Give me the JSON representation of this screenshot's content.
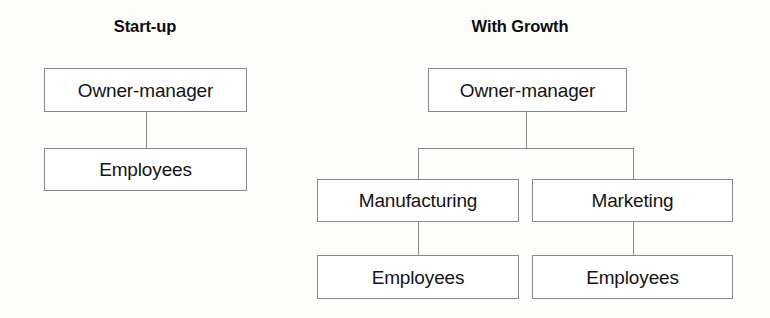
{
  "canvas": {
    "width": 770,
    "height": 318,
    "background": "#fdfdfc",
    "line_color": "#8a8a8a",
    "text_color": "#141414"
  },
  "panels": [
    {
      "id": "startup",
      "title": "Start-up",
      "nodes": [
        {
          "id": "startup-owner-manager",
          "label": "Owner-manager"
        },
        {
          "id": "startup-employees",
          "label": "Employees"
        }
      ]
    },
    {
      "id": "with-growth",
      "title": "With Growth",
      "nodes": [
        {
          "id": "growth-owner-manager",
          "label": "Owner-manager"
        },
        {
          "id": "growth-manufacturing",
          "label": "Manufacturing"
        },
        {
          "id": "growth-marketing",
          "label": "Marketing"
        },
        {
          "id": "growth-employees-manufacturing",
          "label": "Employees"
        },
        {
          "id": "growth-employees-marketing",
          "label": "Employees"
        }
      ]
    }
  ]
}
